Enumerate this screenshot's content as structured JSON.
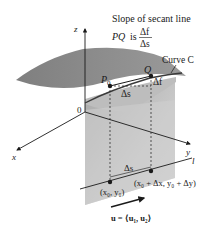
{
  "title": {
    "line1": "Slope of secant line",
    "line2_prefix": "PQ",
    "line2_is": "is",
    "fraction_numerator": "Δf",
    "fraction_denominator": "Δs"
  },
  "axes": {
    "z_label": "z",
    "x_label": "x",
    "y_label": "y",
    "origin_label": "0",
    "line_label": "l"
  },
  "points": {
    "p0_label": "P",
    "p0_subscript": "0",
    "q_label": "Q"
  },
  "annotations": {
    "curve_label": "Curve C",
    "delta_f": "Δf",
    "delta_s_upper": "Δs",
    "delta_s_lower": "Δs",
    "base_point": "(x₀, y₀)",
    "shifted_point": "(x₀ + Δx, y₀ + Δy)",
    "direction_vector": "u = ⟨u₁, u₂⟩"
  },
  "colors": {
    "surface_top": "#8c8c8c",
    "surface_front": "#b5b5b5",
    "plane": "#c8c8c8",
    "plane_dark": "#a8a8a8",
    "ink": "#1a1a1a",
    "background": "#ffffff"
  }
}
